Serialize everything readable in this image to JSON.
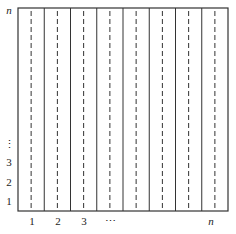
{
  "diagram": {
    "columns": 8,
    "frame": {
      "left": 18,
      "top": 8,
      "right": 228,
      "bottom": 211
    },
    "colors": {
      "line": "#333333",
      "dashed": "#333333",
      "background": "#ffffff"
    },
    "y_axis_labels": [
      {
        "text": "n",
        "y": 10,
        "italic": true
      },
      {
        "text": "⋮",
        "y": 144,
        "italic": false
      },
      {
        "text": "3",
        "y": 162,
        "italic": false
      },
      {
        "text": "2",
        "y": 182,
        "italic": false
      },
      {
        "text": "1",
        "y": 201,
        "italic": false
      }
    ],
    "x_axis_labels": [
      {
        "text": "1",
        "x": 32,
        "italic": false
      },
      {
        "text": "2",
        "x": 58,
        "italic": false
      },
      {
        "text": "3",
        "x": 84,
        "italic": false
      },
      {
        "text": "⋯",
        "x": 110,
        "italic": false
      },
      {
        "text": "n",
        "x": 211,
        "italic": true
      }
    ]
  }
}
